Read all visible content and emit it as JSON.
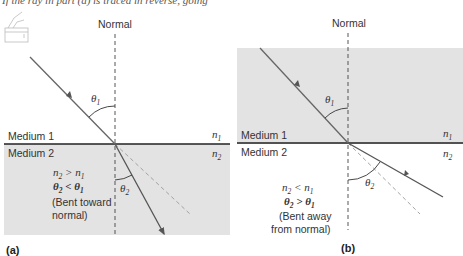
{
  "header_text_fragment": "If the ray in part (a) is traced in reverse, going",
  "colors": {
    "medium_fill": "#e3e3e3",
    "ray": "#555555",
    "normal": "#444444",
    "extension": "#9a9a9a",
    "interface": "#222222"
  },
  "panel_a": {
    "label": "(a)",
    "normal_label": "Normal",
    "medium1_label": "Medium 1",
    "medium2_label": "Medium 2",
    "n1": "n",
    "n1_sub": "1",
    "n2": "n",
    "n2_sub": "2",
    "theta1": "θ",
    "theta1_sub": "1",
    "theta2": "θ",
    "theta2_sub": "2",
    "relation_line1": {
      "a": "n",
      "a_sub": "2",
      "op": " > ",
      "b": "n",
      "b_sub": "1"
    },
    "relation_line2": {
      "a": "θ",
      "a_sub": "2",
      "op": " < ",
      "b": "θ",
      "b_sub": "1"
    },
    "note_line1": "(Bent toward",
    "note_line2": "normal)"
  },
  "panel_b": {
    "label": "(b)",
    "normal_label": "Normal",
    "medium1_label": "Medium 1",
    "medium2_label": "Medium 2",
    "n1": "n",
    "n1_sub": "1",
    "n2": "n",
    "n2_sub": "2",
    "theta1": "θ",
    "theta1_sub": "1",
    "theta2": "θ",
    "theta2_sub": "2",
    "relation_line1": {
      "a": "n",
      "a_sub": "2",
      "op": " < ",
      "b": "n",
      "b_sub": "1"
    },
    "relation_line2": {
      "a": "θ",
      "a_sub": "2",
      "op": " > ",
      "b": "θ",
      "b_sub": "1"
    },
    "note_line1": "(Bent away",
    "note_line2": "from normal)"
  }
}
